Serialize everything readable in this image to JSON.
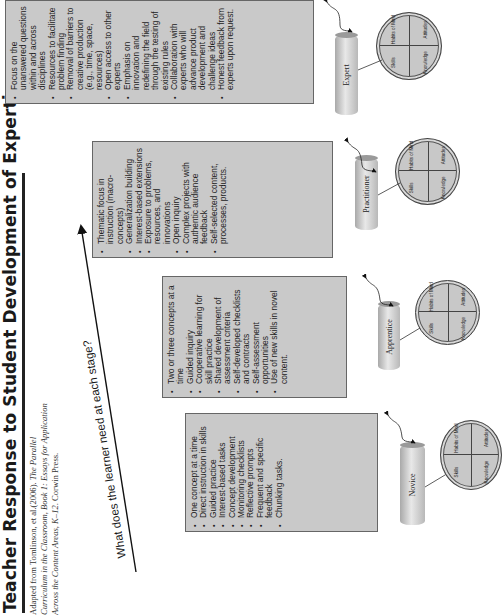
{
  "title": "Teacher Response to Student Development of Expertise",
  "citation": {
    "line1_prefix": "Adapted from Tomlinson, et al.(2006). ",
    "line1_italic": "The Parallel",
    "line2_italic": "Curriculum in the Classroom, Book 1: Essays for Application",
    "line3_italic": "Across the Content Areas, K–12",
    "line3_suffix": ". Corwin Press."
  },
  "question": "What  does the learner need at each stage?",
  "colors": {
    "box_fill": "#c9c9c9",
    "box_border": "#666666",
    "arrow": "#111111",
    "background": "#ffffff"
  },
  "circle_labels": {
    "knowledge": "Knowledge",
    "skills": "Skills",
    "attitudes": "Attitudes",
    "habits": "Habits of Mind"
  },
  "stages": [
    {
      "name": "Novice",
      "items": [
        "One concept at a time",
        "Direct instruction in skills",
        "Guided practice",
        "Interest-based tasks",
        "Concept development",
        "Monitoring checklists",
        "Reflective prompts",
        "Frequent and specific feedback",
        "Chunking tasks."
      ]
    },
    {
      "name": "Apprentice",
      "items": [
        "Two or three concepts at a time",
        "Guided inquiry",
        "Cooperative learning for skill practice",
        "Shared development of assessment criteria",
        "Self-developed checklists and contracts",
        "Self-assessment opportunities",
        "Use of new skills in novel content."
      ]
    },
    {
      "name": "Practitioner",
      "items": [
        "Thematic focus in instruction (macro-concepts)",
        "Generalization building",
        "Interest-based extensions",
        "Exposure to problems, resources, and innovations",
        "Open inquiry",
        "Complex projects with authentic audience feedback",
        "Self-selected content, processes, products."
      ]
    },
    {
      "name": "Expert",
      "items": [
        "Focus on the unanswered questions within and across disciplines",
        "Resources to facilitate problem finding",
        "Removal of barriers to creative production (e.g., time, space, resources)",
        "Open access to other experts",
        "Emphasis on innovation and redefining the field through the testing of existing rules",
        "Collaboration with experts who will advance product development and challenge ideas",
        "Honest feedback from experts upon request."
      ]
    }
  ]
}
